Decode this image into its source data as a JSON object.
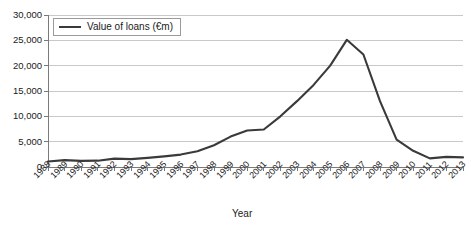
{
  "chart_data": {
    "type": "line",
    "title": "",
    "xlabel": "Year",
    "ylabel": "",
    "categories": [
      "1988",
      "1989",
      "1990",
      "1991",
      "1992",
      "1993",
      "1994",
      "1995",
      "1996",
      "1997",
      "1998",
      "1999",
      "2000",
      "2001",
      "2002",
      "2003",
      "2004",
      "2005",
      "2006",
      "2007",
      "2008",
      "2009",
      "2010",
      "2011",
      "2012",
      "2013"
    ],
    "series": [
      {
        "name": "Value of loans (€m)",
        "color": "#3a3a3a",
        "values": [
          1100,
          1350,
          1200,
          1250,
          1650,
          1550,
          1800,
          2100,
          2450,
          3100,
          4300,
          6000,
          7200,
          7400,
          10000,
          13000,
          16200,
          20000,
          25100,
          22200,
          13000,
          5400,
          3200,
          1700,
          2000,
          1900
        ]
      }
    ],
    "ylim": [
      0,
      30000
    ],
    "yticks": [
      "0",
      "5,000",
      "10,000",
      "15,000",
      "20,000",
      "25,000",
      "30,000"
    ],
    "ytick_values": [
      0,
      5000,
      10000,
      15000,
      20000,
      25000,
      30000
    ],
    "grid": true,
    "grid_color": "#c9c9c9",
    "legend_position": "top-left",
    "legend_entries": [
      "Value of loans (€m)"
    ]
  },
  "axis": {
    "x_title": "Year",
    "axis_color": "#7a7a7a"
  },
  "legend": {
    "label": "Value of loans (€m)"
  }
}
